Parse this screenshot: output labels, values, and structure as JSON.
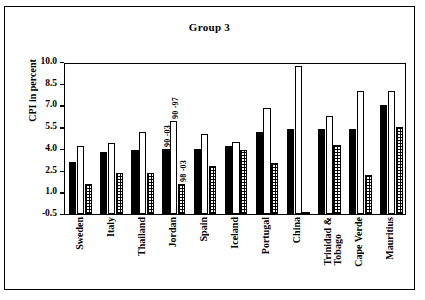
{
  "chart_data": {
    "type": "bar",
    "title": "Group 3",
    "xlabel": "",
    "ylabel": "CPI in percent",
    "ylim": [
      -0.5,
      10.0
    ],
    "yticks": [
      "10.0",
      "8.5",
      "7.0",
      "5.5",
      "4.0",
      "2.5",
      "1.0",
      "-0.5"
    ],
    "ytick_values": [
      10.0,
      8.5,
      7.0,
      5.5,
      4.0,
      2.5,
      1.0,
      -0.5
    ],
    "grid": false,
    "legend": "none",
    "categories": [
      "Sweden",
      "Italy",
      "Thailand",
      "Jordan",
      "Spain",
      "Iceland",
      "Portugal",
      "China",
      "Trinidad & Tobago",
      "Cape Verde",
      "Mauritius"
    ],
    "series": [
      {
        "name": "90 -03",
        "style": "solid-black",
        "values": [
          3.1,
          3.8,
          3.9,
          4.0,
          4.0,
          4.2,
          5.2,
          5.4,
          5.4,
          5.4,
          7.0
        ]
      },
      {
        "name": "90 -97",
        "style": "open-white",
        "values": [
          4.2,
          4.4,
          5.2,
          5.9,
          5.0,
          4.5,
          6.8,
          9.7,
          6.3,
          8.0,
          8.0
        ]
      },
      {
        "name": "98 -03",
        "style": "cross-hatched",
        "values": [
          1.6,
          2.3,
          2.3,
          1.6,
          2.8,
          3.9,
          3.0,
          -0.4,
          4.3,
          2.2,
          5.5
        ]
      }
    ],
    "annotations": [
      {
        "text": "90 -03",
        "category": "Jordan",
        "series": "90 -03"
      },
      {
        "text": "90 -97",
        "category": "Jordan",
        "series": "90 -97"
      },
      {
        "text": "98 -03",
        "category": "Jordan",
        "series": "98 -03"
      }
    ]
  }
}
